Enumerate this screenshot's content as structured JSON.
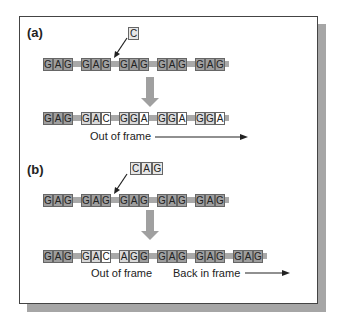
{
  "figure": {
    "panels": [
      {
        "label": "(a)",
        "insertion": [
          "C"
        ],
        "original_strand": [
          {
            "bases": [
              "G",
              "A",
              "G"
            ],
            "shade": [
              "dark",
              "dark",
              "dark"
            ]
          },
          {
            "bases": [
              "G",
              "A",
              "G"
            ],
            "shade": [
              "dark",
              "dark",
              "dark"
            ]
          },
          {
            "bases": [
              "G",
              "A",
              "G"
            ],
            "shade": [
              "dark",
              "dark",
              "dark"
            ]
          },
          {
            "bases": [
              "G",
              "A",
              "G"
            ],
            "shade": [
              "dark",
              "dark",
              "dark"
            ]
          },
          {
            "bases": [
              "G",
              "A",
              "G"
            ],
            "shade": [
              "dark",
              "dark",
              "dark"
            ]
          }
        ],
        "mutated_strand": [
          {
            "bases": [
              "G",
              "A",
              "G"
            ],
            "shade": [
              "dark",
              "dark",
              "dark"
            ]
          },
          {
            "bases": [
              "G",
              "A",
              "C"
            ],
            "shade": [
              "light",
              "light",
              "white"
            ]
          },
          {
            "bases": [
              "G",
              "G",
              "A"
            ],
            "shade": [
              "light",
              "light",
              "white"
            ]
          },
          {
            "bases": [
              "G",
              "G",
              "A"
            ],
            "shade": [
              "light",
              "light",
              "white"
            ]
          },
          {
            "bases": [
              "G",
              "G",
              "A"
            ],
            "shade": [
              "light",
              "light",
              "white"
            ]
          }
        ],
        "captions": [
          "Out of frame"
        ]
      },
      {
        "label": "(b)",
        "insertion": [
          "C",
          "A",
          "G"
        ],
        "original_strand": [
          {
            "bases": [
              "G",
              "A",
              "G"
            ],
            "shade": [
              "dark",
              "dark",
              "dark"
            ]
          },
          {
            "bases": [
              "G",
              "A",
              "G"
            ],
            "shade": [
              "dark",
              "dark",
              "dark"
            ]
          },
          {
            "bases": [
              "G",
              "A",
              "G"
            ],
            "shade": [
              "dark",
              "dark",
              "dark"
            ]
          },
          {
            "bases": [
              "G",
              "A",
              "G"
            ],
            "shade": [
              "dark",
              "dark",
              "dark"
            ]
          },
          {
            "bases": [
              "G",
              "A",
              "G"
            ],
            "shade": [
              "dark",
              "dark",
              "dark"
            ]
          }
        ],
        "mutated_strand": [
          {
            "bases": [
              "G",
              "A",
              "G"
            ],
            "shade": [
              "dark",
              "dark",
              "dark"
            ]
          },
          {
            "bases": [
              "G",
              "A",
              "C"
            ],
            "shade": [
              "light",
              "light",
              "white"
            ]
          },
          {
            "bases": [
              "A",
              "G",
              "G"
            ],
            "shade": [
              "light",
              "light",
              "dark"
            ]
          },
          {
            "bases": [
              "G",
              "A",
              "G"
            ],
            "shade": [
              "dark",
              "dark",
              "dark"
            ]
          },
          {
            "bases": [
              "G",
              "A",
              "G"
            ],
            "shade": [
              "dark",
              "dark",
              "dark"
            ]
          },
          {
            "bases": [
              "G",
              "A",
              "G"
            ],
            "shade": [
              "dark",
              "dark",
              "dark"
            ]
          }
        ],
        "captions": [
          "Out of frame",
          "Back in frame"
        ]
      }
    ],
    "colors": {
      "shaded_base": "#9e9e9e",
      "light_base": "#d9d9d9",
      "backbone": "#a9a9a9",
      "down_arrow": "#a0a0a0",
      "shadow": "#a6a6a6"
    }
  }
}
